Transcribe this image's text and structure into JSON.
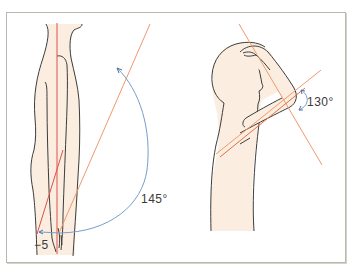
{
  "figures": [
    {
      "id": "shoulder-flexion-side-view",
      "description": "Standing figure, side view, arm range of motion",
      "angle_labels": {
        "main": "145°",
        "negative": "−5"
      }
    },
    {
      "id": "arm-raised-over-head",
      "description": "Figure with hand on head, elbow flexion",
      "angle_labels": {
        "main": "130°"
      }
    }
  ],
  "colors": {
    "skin": "#fbeee0",
    "outline": "#3c3c3c",
    "reference_line_red": "#e0504a",
    "reference_line_orange": "#ee9a6e",
    "arc_blue": "#7a9cc9",
    "frame": "#b9b6ae"
  }
}
